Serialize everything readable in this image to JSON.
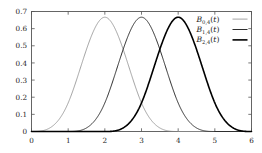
{
  "chart_data": {
    "type": "line",
    "title": "",
    "xlabel": "",
    "ylabel": "",
    "xlim": [
      0,
      6
    ],
    "ylim": [
      0,
      0.7
    ],
    "grid": false,
    "legend_position": "top-right",
    "xticks": [
      "0",
      "1",
      "2",
      "3",
      "4",
      "5",
      "6"
    ],
    "xtick_values": [
      0,
      1,
      2,
      3,
      4,
      5,
      6
    ],
    "yticks": [
      "0",
      "0.1",
      "0.2",
      "0.3",
      "0.4",
      "0.5",
      "0.6",
      "0.7"
    ],
    "ytick_values": [
      0,
      0.1,
      0.2,
      0.3,
      0.4,
      0.5,
      0.6,
      0.7
    ],
    "series": [
      {
        "name": "B_{0,4}(t)",
        "legend_base": "B",
        "legend_sub": "0,4",
        "legend_arg": "(t)",
        "color": "#8c8c8c",
        "width": 0.8,
        "peak_x": 2,
        "peak_y": 0.667,
        "support": [
          0,
          4
        ],
        "x": [
          0,
          0.25,
          0.5,
          0.75,
          1,
          1.25,
          1.5,
          1.75,
          2,
          2.25,
          2.5,
          2.75,
          3,
          3.25,
          3.5,
          3.75,
          4
        ],
        "values": [
          0,
          0.0026,
          0.0208,
          0.0703,
          0.1667,
          0.3151,
          0.4792,
          0.6068,
          0.6667,
          0.6068,
          0.4792,
          0.3151,
          0.1667,
          0.0703,
          0.0208,
          0.0026,
          0
        ]
      },
      {
        "name": "B_{1,4}(t)",
        "legend_base": "B",
        "legend_sub": "1,4",
        "legend_arg": "(t)",
        "color": "#2e2e2e",
        "width": 1.0,
        "peak_x": 3,
        "peak_y": 0.667,
        "support": [
          1,
          5
        ],
        "x": [
          1,
          1.25,
          1.5,
          1.75,
          2,
          2.25,
          2.5,
          2.75,
          3,
          3.25,
          3.5,
          3.75,
          4,
          4.25,
          4.5,
          4.75,
          5
        ],
        "values": [
          0,
          0.0026,
          0.0208,
          0.0703,
          0.1667,
          0.3151,
          0.4792,
          0.6068,
          0.6667,
          0.6068,
          0.4792,
          0.3151,
          0.1667,
          0.0703,
          0.0208,
          0.0026,
          0
        ]
      },
      {
        "name": "B_{2,4}(t)",
        "legend_base": "B",
        "legend_sub": "2,4",
        "legend_arg": "(t)",
        "color": "#000000",
        "width": 1.6,
        "peak_x": 4,
        "peak_y": 0.667,
        "support": [
          2,
          6
        ],
        "x": [
          2,
          2.25,
          2.5,
          2.75,
          3,
          3.25,
          3.5,
          3.75,
          4,
          4.25,
          4.5,
          4.75,
          5,
          5.25,
          5.5,
          5.75,
          6
        ],
        "values": [
          0,
          0.0026,
          0.0208,
          0.0703,
          0.1667,
          0.3151,
          0.4792,
          0.6068,
          0.6667,
          0.6068,
          0.4792,
          0.3151,
          0.1667,
          0.0703,
          0.0208,
          0.0026,
          0
        ]
      }
    ]
  },
  "axes": {
    "frame_color": "#555555",
    "tick_color": "#555555"
  }
}
